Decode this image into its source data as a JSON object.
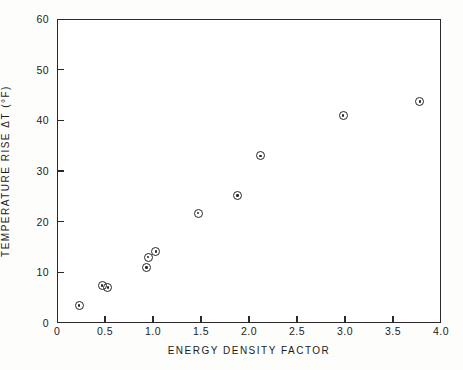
{
  "chart_data": {
    "type": "scatter",
    "title": "",
    "xlabel": "ENERGY DENSITY FACTOR",
    "ylabel": "TEMPERATURE RISE ΔT (°F)",
    "xlim": [
      0,
      4.0
    ],
    "ylim": [
      0,
      60
    ],
    "grid": false,
    "legend": null,
    "marker": "circle-with-center-dot",
    "xticks": [
      0,
      0.5,
      1.0,
      1.5,
      2.0,
      2.5,
      3.0,
      3.5,
      4.0
    ],
    "xtick_labels": [
      "0",
      "0.5",
      "1.0",
      "1.5",
      "2.0",
      "2.5",
      "3.0",
      "3.5",
      "4.0"
    ],
    "yticks": [
      0,
      10,
      20,
      30,
      40,
      50,
      60
    ],
    "ytick_labels": [
      "0",
      "10",
      "20",
      "30",
      "40",
      "50",
      "60"
    ],
    "points": [
      {
        "x": 0.23,
        "y": 3.5
      },
      {
        "x": 0.47,
        "y": 7.4
      },
      {
        "x": 0.53,
        "y": 7.0
      },
      {
        "x": 0.93,
        "y": 10.9
      },
      {
        "x": 0.95,
        "y": 13.0
      },
      {
        "x": 1.03,
        "y": 14.1
      },
      {
        "x": 1.47,
        "y": 21.7
      },
      {
        "x": 1.88,
        "y": 25.2
      },
      {
        "x": 2.12,
        "y": 33.0
      },
      {
        "x": 2.98,
        "y": 41.0
      },
      {
        "x": 3.78,
        "y": 43.7
      }
    ]
  },
  "colors": {
    "axis": "#2a2a2a",
    "marker": "#262626",
    "background": "#fdfdfc",
    "plot_background": "#ffffff"
  }
}
